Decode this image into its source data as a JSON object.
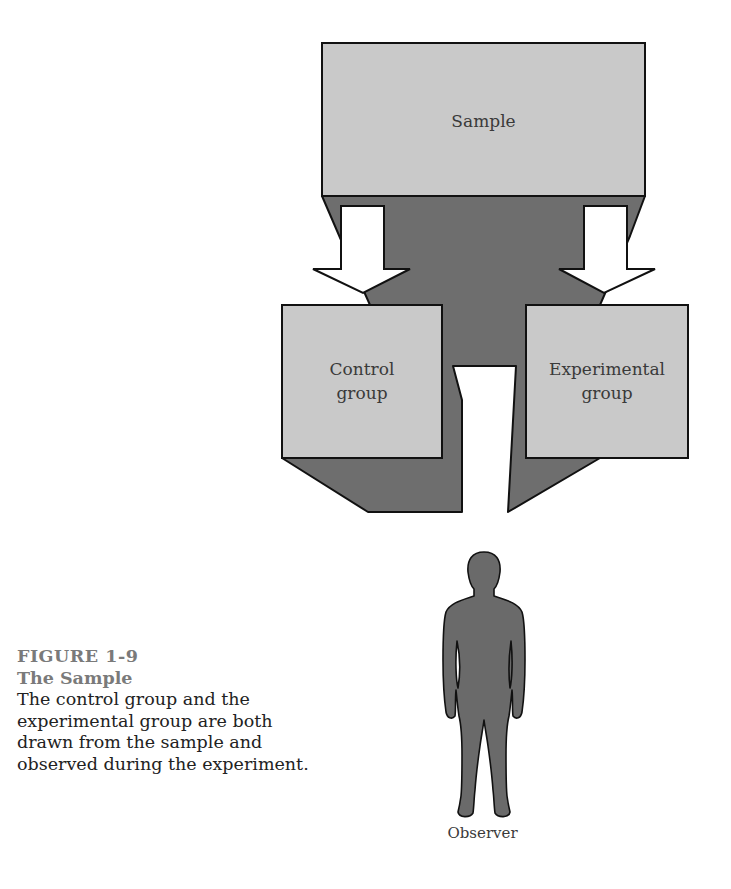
{
  "diagram": {
    "nodes": {
      "sample": {
        "label": "Sample"
      },
      "control": {
        "label_line1": "Control",
        "label_line2": "group"
      },
      "experimental": {
        "label_line1": "Experimental",
        "label_line2": "group"
      },
      "observer": {
        "label": "Observer",
        "icon": "human-figure-icon"
      }
    },
    "edges": [
      {
        "from": "Sample",
        "to": "Control group",
        "icon": "arrow-down-icon"
      },
      {
        "from": "Sample",
        "to": "Experimental group",
        "icon": "arrow-down-icon"
      }
    ],
    "colors": {
      "box_fill": "#c9c9c9",
      "shadow_fill": "#6e6e6e",
      "outline": "#111111",
      "arrow_fill": "#ffffff",
      "figure_fill": "#6a6a6a"
    }
  },
  "caption": {
    "figure_number": "FIGURE 1-9",
    "title": "The Sample",
    "body": "The control group and the experimental group are both drawn from the sample and observed during the experiment."
  }
}
